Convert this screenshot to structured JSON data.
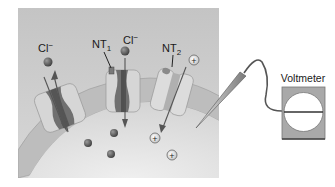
{
  "diagram": {
    "type": "neuron membrane ion channels with voltmeter",
    "labels": {
      "cl_left": "Cl",
      "cl_left_sup": "−",
      "nt1_main": "NT",
      "nt1_sub": "1",
      "cl_mid": "Cl",
      "cl_mid_sup": "−",
      "nt2_main": "NT",
      "nt2_sub": "2",
      "voltmeter": "Voltmeter"
    },
    "ions": {
      "cation_symbol": "+"
    },
    "colors": {
      "panel_bg": "#c9c9c9",
      "cell_interior": "#e2e2e2",
      "membrane": "#bdbdbd",
      "channel_outer": "#d6d6d6",
      "channel_core": "#6f6f6f",
      "anion": "#5a5a5a",
      "voltmeter_box": "#a9a9a9",
      "voltmeter_face": "#ffffff"
    }
  }
}
